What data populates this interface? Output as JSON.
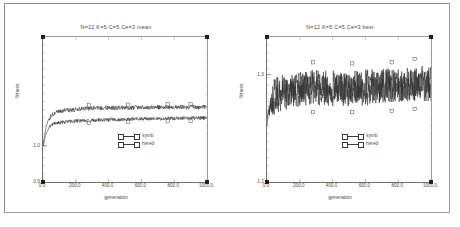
{
  "page": {
    "background_color": "#ffffff",
    "frame_color": "#8e8e8e"
  },
  "chart_data": [
    {
      "id": "left",
      "type": "line",
      "title": "N=12 K=5 C=5 Ce=3 mean",
      "xlabel": "generation",
      "ylabel": "fitness",
      "xlim": [
        0,
        1000
      ],
      "ylim": [
        0.9,
        1.3
      ],
      "xticks": [
        0,
        200,
        400,
        600,
        800,
        1000
      ],
      "xtick_labels": [
        "0.0",
        "200.0",
        "400.0",
        "600.0",
        "800.0",
        "1000.0"
      ],
      "yticks": [
        1.0
      ],
      "ytick_labels": [
        "1.0"
      ],
      "ybottom_label": "0.9",
      "grid": false,
      "legend_position": "center-right",
      "series": [
        {
          "name": "symb",
          "color": "#2f2f2f",
          "marker": "square-open",
          "x": [
            0,
            10,
            20,
            30,
            40,
            50,
            60,
            70,
            80,
            90,
            100,
            120,
            140,
            160,
            180,
            200,
            220,
            240,
            260,
            280,
            300,
            320,
            340,
            360,
            380,
            400,
            420,
            440,
            460,
            480,
            500,
            520,
            540,
            560,
            580,
            600,
            620,
            640,
            660,
            680,
            700,
            720,
            740,
            760,
            780,
            800,
            820,
            840,
            860,
            880,
            900,
            920,
            940,
            960,
            980,
            1000
          ],
          "values": [
            1.0,
            1.03,
            1.055,
            1.068,
            1.076,
            1.082,
            1.086,
            1.089,
            1.091,
            1.093,
            1.094,
            1.096,
            1.097,
            1.098,
            1.099,
            1.1,
            1.101,
            1.102,
            1.103,
            1.103,
            1.104,
            1.104,
            1.103,
            1.104,
            1.105,
            1.104,
            1.105,
            1.104,
            1.105,
            1.105,
            1.104,
            1.105,
            1.105,
            1.106,
            1.105,
            1.106,
            1.105,
            1.106,
            1.106,
            1.105,
            1.106,
            1.106,
            1.107,
            1.106,
            1.106,
            1.107,
            1.106,
            1.107,
            1.107,
            1.106,
            1.107,
            1.107,
            1.106,
            1.107,
            1.107,
            1.107
          ],
          "noise_amplitude": 0.006
        },
        {
          "name": "hered",
          "color": "#2f2f2f",
          "marker": "square-open",
          "x": [
            0,
            10,
            20,
            30,
            40,
            50,
            60,
            70,
            80,
            90,
            100,
            120,
            140,
            160,
            180,
            200,
            220,
            240,
            260,
            280,
            300,
            320,
            340,
            360,
            380,
            400,
            420,
            440,
            460,
            480,
            500,
            520,
            540,
            560,
            580,
            600,
            620,
            640,
            660,
            680,
            700,
            720,
            740,
            760,
            780,
            800,
            820,
            840,
            860,
            880,
            900,
            920,
            940,
            960,
            980,
            1000
          ],
          "values": [
            0.998,
            1.018,
            1.035,
            1.046,
            1.052,
            1.056,
            1.059,
            1.061,
            1.062,
            1.063,
            1.064,
            1.065,
            1.066,
            1.067,
            1.067,
            1.068,
            1.068,
            1.069,
            1.069,
            1.07,
            1.07,
            1.07,
            1.071,
            1.071,
            1.071,
            1.072,
            1.072,
            1.072,
            1.072,
            1.073,
            1.073,
            1.073,
            1.073,
            1.074,
            1.074,
            1.074,
            1.074,
            1.074,
            1.075,
            1.074,
            1.075,
            1.075,
            1.075,
            1.075,
            1.076,
            1.075,
            1.076,
            1.076,
            1.076,
            1.076,
            1.076,
            1.077,
            1.076,
            1.077,
            1.077,
            1.077
          ],
          "noise_amplitude": 0.005
        }
      ]
    },
    {
      "id": "right",
      "type": "line",
      "title": "N=12 K=5 C=5 Ce=3 best",
      "xlabel": "generation",
      "ylabel": "fitness",
      "xlim": [
        0,
        1000
      ],
      "ylim": [
        1.2,
        1.335
      ],
      "xticks": [
        0,
        200,
        400,
        600,
        800,
        1000
      ],
      "xtick_labels": [
        "0.0",
        "200.0",
        "400.0",
        "600.0",
        "800.0",
        "1000.0"
      ],
      "yticks": [
        1.3
      ],
      "ytick_labels": [
        "1.3"
      ],
      "ybottom_label": "1.2",
      "grid": false,
      "legend_position": "center-right",
      "series": [
        {
          "name": "symb",
          "color": "#2f2f2f",
          "marker": "square-open",
          "x": [
            0,
            10,
            20,
            30,
            40,
            50,
            60,
            70,
            80,
            90,
            100,
            120,
            140,
            160,
            180,
            200,
            220,
            240,
            260,
            280,
            300,
            320,
            340,
            360,
            380,
            400,
            420,
            440,
            460,
            480,
            500,
            520,
            540,
            560,
            580,
            600,
            620,
            640,
            660,
            680,
            700,
            720,
            740,
            760,
            780,
            800,
            820,
            840,
            860,
            880,
            900,
            920,
            940,
            960,
            980,
            1000
          ],
          "values": [
            1.258,
            1.268,
            1.274,
            1.277,
            1.28,
            1.281,
            1.282,
            1.283,
            1.284,
            1.284,
            1.285,
            1.285,
            1.286,
            1.286,
            1.286,
            1.287,
            1.287,
            1.288,
            1.288,
            1.289,
            1.29,
            1.289,
            1.288,
            1.288,
            1.287,
            1.288,
            1.287,
            1.287,
            1.288,
            1.288,
            1.287,
            1.288,
            1.288,
            1.289,
            1.288,
            1.289,
            1.289,
            1.289,
            1.289,
            1.29,
            1.289,
            1.29,
            1.29,
            1.289,
            1.29,
            1.29,
            1.291,
            1.29,
            1.291,
            1.291,
            1.292,
            1.291,
            1.292,
            1.292,
            1.291,
            1.292
          ],
          "noise_amplitude": 0.016
        },
        {
          "name": "hered",
          "color": "#2f2f2f",
          "marker": "square-open",
          "x": [
            0,
            10,
            20,
            30,
            40,
            50,
            60,
            70,
            80,
            90,
            100,
            120,
            140,
            160,
            180,
            200,
            220,
            240,
            260,
            280,
            300,
            320,
            340,
            360,
            380,
            400,
            420,
            440,
            460,
            480,
            500,
            520,
            540,
            560,
            580,
            600,
            620,
            640,
            660,
            680,
            700,
            720,
            740,
            760,
            780,
            800,
            820,
            840,
            860,
            880,
            900,
            920,
            940,
            960,
            980,
            1000
          ],
          "values": [
            1.252,
            1.264,
            1.27,
            1.274,
            1.276,
            1.278,
            1.279,
            1.28,
            1.281,
            1.281,
            1.282,
            1.282,
            1.283,
            1.283,
            1.284,
            1.284,
            1.285,
            1.285,
            1.286,
            1.286,
            1.287,
            1.286,
            1.286,
            1.285,
            1.285,
            1.285,
            1.285,
            1.285,
            1.286,
            1.286,
            1.285,
            1.286,
            1.286,
            1.286,
            1.286,
            1.287,
            1.286,
            1.287,
            1.287,
            1.287,
            1.287,
            1.288,
            1.288,
            1.287,
            1.288,
            1.288,
            1.288,
            1.288,
            1.289,
            1.289,
            1.289,
            1.289,
            1.29,
            1.289,
            1.29,
            1.29
          ],
          "noise_amplitude": 0.015
        }
      ]
    }
  ]
}
